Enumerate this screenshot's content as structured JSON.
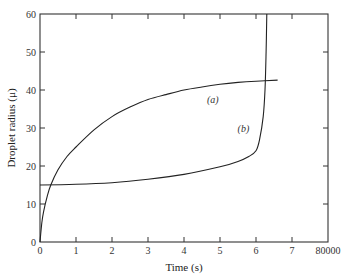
{
  "chart_data": {
    "type": "line",
    "title": "",
    "xlabel": "Time (s)",
    "ylabel": "Droplet radius (μ)",
    "xlim": [
      0,
      8
    ],
    "ylim": [
      0,
      60
    ],
    "grid": false,
    "legend": "none (inline curve labels)",
    "x_ticks": [
      0,
      1,
      2,
      3,
      4,
      5,
      6,
      7,
      8
    ],
    "x_tick_labels": [
      "0",
      "1",
      "2",
      "3",
      "4",
      "5",
      "6",
      "7",
      "80000"
    ],
    "y_ticks": [
      0,
      10,
      20,
      30,
      40,
      50,
      60
    ],
    "y_tick_labels": [
      "0",
      "10",
      "20",
      "30",
      "40",
      "50",
      "60"
    ],
    "series": [
      {
        "name": "(a)",
        "label_position": [
          4.8,
          36.5
        ],
        "x": [
          0,
          0.05,
          0.1,
          0.2,
          0.3,
          0.5,
          0.75,
          1,
          1.5,
          2,
          2.5,
          3,
          3.5,
          4,
          4.5,
          5,
          5.5,
          6,
          6.6
        ],
        "values": [
          0,
          5,
          8,
          12,
          15,
          19,
          22.5,
          25,
          29.5,
          33,
          35.5,
          37.5,
          38.8,
          40,
          40.8,
          41.5,
          42,
          42.3,
          42.6
        ]
      },
      {
        "name": "(b)",
        "label_position": [
          5.65,
          29
        ],
        "x": [
          0,
          1,
          2,
          3,
          4,
          5,
          5.5,
          5.8,
          6,
          6.1,
          6.2,
          6.25,
          6.28,
          6.3
        ],
        "values": [
          15,
          15.2,
          15.6,
          16.5,
          17.8,
          19.8,
          21.2,
          22.5,
          24,
          27,
          33,
          40,
          50,
          60
        ]
      }
    ]
  }
}
